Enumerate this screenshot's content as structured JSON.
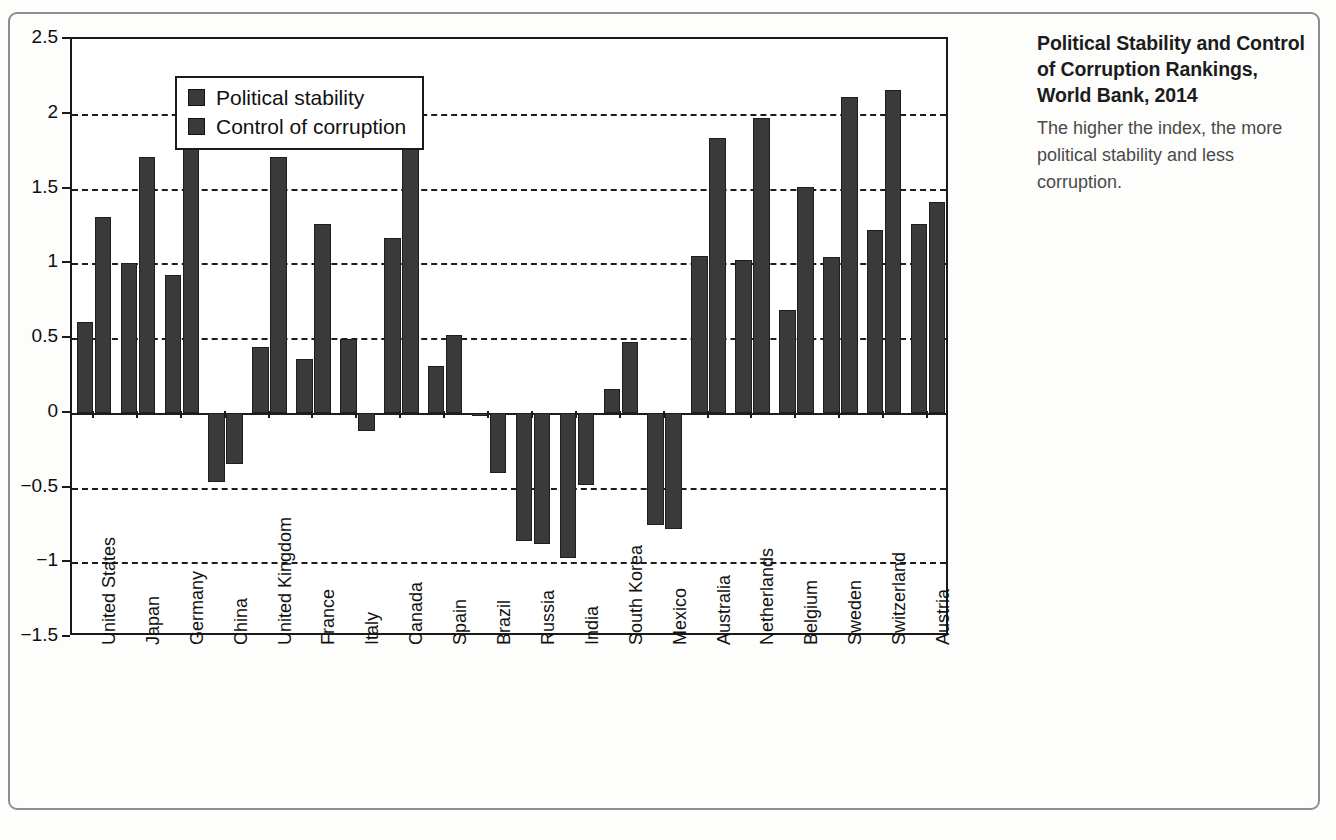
{
  "figure": {
    "number_label": "FIGURE 13.1",
    "caption_title": "Political Stability and Control of Corruption Rankings, World Bank, 2014",
    "caption_body": "The higher the index, the more political stability and less corruption."
  },
  "legend": {
    "position": "top-left-inside",
    "entries": [
      {
        "label": "Political stability",
        "color": "#3a3a3a"
      },
      {
        "label": "Control of corruption",
        "color": "#3a3a3a"
      }
    ]
  },
  "axis": {
    "y_title": "Indicator Value",
    "y_ticks": [
      "2.5",
      "2",
      "1.5",
      "1",
      "0.5",
      "0",
      "−0.5",
      "−1",
      "−1.5"
    ]
  },
  "chart_data": {
    "type": "bar",
    "title": "Political Stability and Control of Corruption Rankings, World Bank, 2014",
    "xlabel": "",
    "ylabel": "Indicator Value",
    "ylim": [
      -1.5,
      2.5
    ],
    "ytick_values": [
      2.5,
      2,
      1.5,
      1,
      0.5,
      0,
      -0.5,
      -1,
      -1.5
    ],
    "grid": "horizontal-dashed",
    "legend_position": "inside top-left",
    "categories": [
      "United States",
      "Japan",
      "Germany",
      "China",
      "United Kingdom",
      "France",
      "Italy",
      "Canada",
      "Spain",
      "Brazil",
      "Russia",
      "India",
      "South Korea",
      "Mexico",
      "Australia",
      "Netherlands",
      "Belgium",
      "Sweden",
      "Switzerland",
      "Austria"
    ],
    "series": [
      {
        "name": "Political stability",
        "color": "#3a3a3a",
        "values": [
          0.61,
          1.0,
          0.92,
          -0.46,
          0.44,
          0.36,
          0.49,
          1.17,
          0.31,
          -0.02,
          -0.86,
          -0.97,
          0.16,
          -0.75,
          1.05,
          1.02,
          0.69,
          1.04,
          1.22,
          1.26
        ]
      },
      {
        "name": "Control of corruption",
        "color": "#3a3a3a",
        "values": [
          1.31,
          1.71,
          1.81,
          -0.34,
          1.71,
          1.26,
          -0.12,
          1.8,
          0.52,
          -0.4,
          -0.88,
          -0.48,
          0.47,
          -0.78,
          1.84,
          1.97,
          1.51,
          2.11,
          2.16,
          1.41
        ]
      }
    ]
  }
}
